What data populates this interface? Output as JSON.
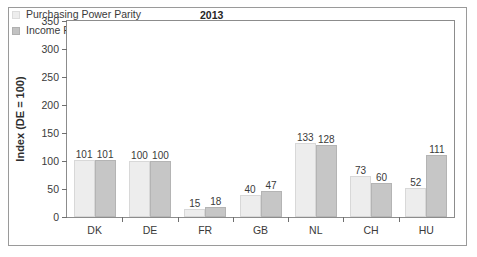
{
  "chart_data": {
    "type": "bar",
    "title": "",
    "annotation": "2013",
    "xlabel": "",
    "ylabel": "Index (DE = 100)",
    "ylim": [
      0,
      350
    ],
    "yticks": [
      0,
      50,
      100,
      150,
      200,
      250,
      300,
      350
    ],
    "grid": false,
    "legend_position": "top-left",
    "categories": [
      "DK",
      "DE",
      "FR",
      "GB",
      "NL",
      "CH",
      "HU"
    ],
    "series": [
      {
        "name": "Purchasing Power Parity",
        "color": "#ededed",
        "values": [
          101,
          100,
          15,
          40,
          133,
          73,
          52
        ]
      },
      {
        "name": "Income Ratios",
        "color": "#c6c6c6",
        "values": [
          101,
          100,
          18,
          47,
          128,
          60,
          111
        ]
      }
    ]
  },
  "legend": {
    "items": [
      {
        "label": "Purchasing Power Parity",
        "swatch": "legend-swatch-light"
      },
      {
        "label": "Income Ratios",
        "swatch": "legend-swatch-gray"
      }
    ]
  },
  "axes": {
    "y_title": "Index (DE = 100)",
    "y_tick_labels": [
      "350",
      "300",
      "250",
      "200",
      "150",
      "100",
      "50",
      "0"
    ],
    "x_tick_labels": [
      "DK",
      "DE",
      "FR",
      "GB",
      "NL",
      "CH",
      "HU"
    ]
  },
  "annotation": {
    "year": "2013"
  }
}
